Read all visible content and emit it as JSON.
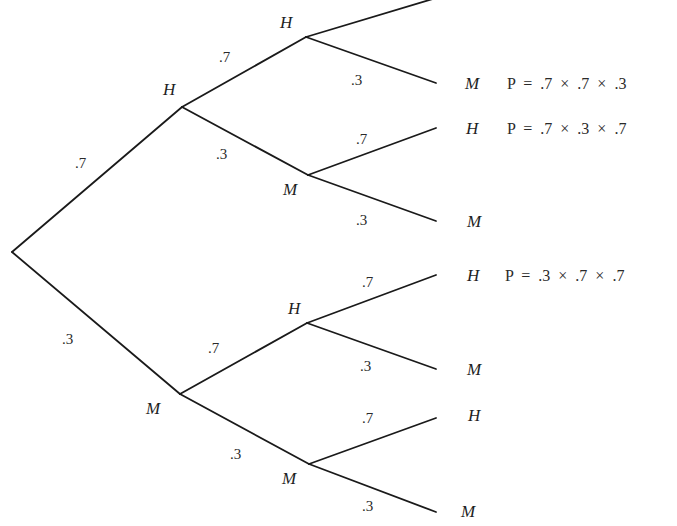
{
  "diagram": {
    "type": "probability-tree",
    "outcomes": {
      "hit": "H",
      "miss": "M"
    },
    "level1": {
      "hit": {
        "label": "H",
        "prob": ".7"
      },
      "miss": {
        "label": "M",
        "prob": ".3"
      }
    },
    "level2": {
      "hh": {
        "label": "H",
        "prob": ".7"
      },
      "hm": {
        "label": "M",
        "prob": ".3"
      },
      "mh": {
        "label": "H",
        "prob": ".7"
      },
      "mm": {
        "label": "M",
        "prob": ".3"
      }
    },
    "level3": {
      "hhh": {
        "label": "H",
        "prob": ".7"
      },
      "hhm": {
        "label": "M",
        "prob": ".3",
        "formula": "P  =  .7  ×  .7  ×  .3"
      },
      "hmh": {
        "label": "H",
        "prob": ".7",
        "formula": "P  =  .7  ×  .3  ×  .7"
      },
      "hmm": {
        "label": "M",
        "prob": ".3"
      },
      "mhh": {
        "label": "H",
        "prob": ".7",
        "formula": "P  =  .3  ×  .7  ×  .7"
      },
      "mhm": {
        "label": "M",
        "prob": ".3"
      },
      "mmh": {
        "label": "H",
        "prob": ".7"
      },
      "mmm": {
        "label": "M",
        "prob": ".3"
      }
    }
  }
}
